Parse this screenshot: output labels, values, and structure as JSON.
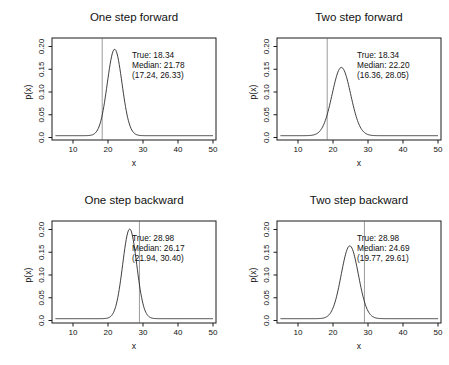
{
  "style": {
    "background": "#ffffff",
    "axis_color": "#1a1a1a",
    "curve_color": "#2a2a2a",
    "vline_color": "#9b9b9b",
    "text_color": "#111111"
  },
  "chart_data": [
    {
      "type": "line",
      "title": "One step forward",
      "xlabel": "x",
      "ylabel": "p(x)",
      "xticks": [
        10,
        20,
        30,
        40,
        50
      ],
      "yticks": [
        "0.0",
        "0.05",
        "0.10",
        "0.15",
        "0.20"
      ],
      "xlim": [
        4,
        51
      ],
      "ylim": [
        0,
        0.22
      ],
      "true_value": 18.34,
      "median": 21.78,
      "interval": [
        17.24,
        26.33
      ],
      "annotation": [
        "True: 18.34",
        "Median: 21.78",
        "(17.24, 26.33)"
      ],
      "curve": {
        "mode": 21.9,
        "sigma": 2.1,
        "peak": 0.19,
        "base": 0.004,
        "x_range": [
          5,
          50
        ]
      }
    },
    {
      "type": "line",
      "title": "Two step forward",
      "xlabel": "x",
      "ylabel": "p(x)",
      "xticks": [
        10,
        20,
        30,
        40,
        50
      ],
      "yticks": [
        "0.0",
        "0.05",
        "0.10",
        "0.15",
        "0.20"
      ],
      "xlim": [
        4,
        51
      ],
      "ylim": [
        0,
        0.22
      ],
      "true_value": 18.34,
      "median": 22.2,
      "interval": [
        16.36,
        28.05
      ],
      "annotation": [
        "True: 18.34",
        "Median: 22.20",
        "(16.36, 28.05)"
      ],
      "curve": {
        "mode": 22.4,
        "sigma": 2.65,
        "peak": 0.15,
        "base": 0.004,
        "x_range": [
          5,
          50
        ]
      }
    },
    {
      "type": "line",
      "title": "One step backward",
      "xlabel": "x",
      "ylabel": "p(x)",
      "xticks": [
        10,
        20,
        30,
        40,
        50
      ],
      "yticks": [
        "0.0",
        "0.05",
        "0.10",
        "0.15",
        "0.20"
      ],
      "xlim": [
        4,
        51
      ],
      "ylim": [
        0,
        0.22
      ],
      "true_value": 28.98,
      "median": 26.17,
      "interval": [
        21.94,
        30.4
      ],
      "annotation": [
        "True: 28.98",
        "Median: 26.17",
        "(21.94, 30.40)"
      ],
      "curve": {
        "mode": 26.2,
        "sigma": 2.0,
        "peak": 0.197,
        "base": 0.004,
        "x_range": [
          5,
          50
        ]
      }
    },
    {
      "type": "line",
      "title": "Two step backward",
      "xlabel": "x",
      "ylabel": "p(x)",
      "xticks": [
        10,
        20,
        30,
        40,
        50
      ],
      "yticks": [
        "0.0",
        "0.05",
        "0.10",
        "0.15",
        "0.20"
      ],
      "xlim": [
        4,
        51
      ],
      "ylim": [
        0,
        0.22
      ],
      "true_value": 28.98,
      "median": 24.69,
      "interval": [
        19.77,
        29.61
      ],
      "annotation": [
        "True: 28.98",
        "Median: 24.69",
        "(19.77, 29.61)"
      ],
      "curve": {
        "mode": 24.8,
        "sigma": 2.45,
        "peak": 0.16,
        "base": 0.004,
        "x_range": [
          5,
          50
        ]
      }
    }
  ]
}
